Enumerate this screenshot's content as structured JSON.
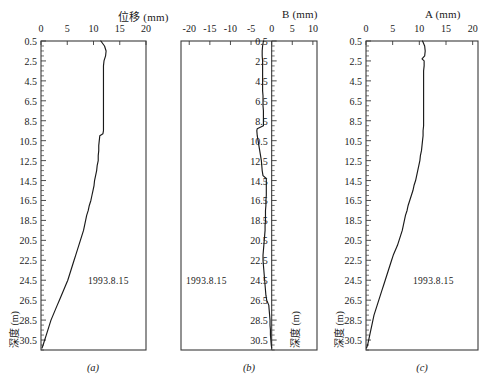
{
  "figure": {
    "background": "#ffffff",
    "line_color": "#1a1a1a",
    "axis_color": "#3a3a3a",
    "panels": [
      {
        "key": "a",
        "caption": "(a)",
        "axis_title": "位移 (mm)",
        "xlabel": "位移 (mm)",
        "ylabel": "深度 (m)",
        "annotation": "1993.8.15",
        "xticks": [
          0,
          5,
          10,
          15,
          20
        ],
        "xlim": [
          0,
          20
        ],
        "ylim": [
          0.5,
          31.5
        ],
        "yticks": [
          0.5,
          2.5,
          4.5,
          6.5,
          8.5,
          10.5,
          12.5,
          14.5,
          16.5,
          18.5,
          20.5,
          22.5,
          24.5,
          26.5,
          28.5,
          30.5
        ]
      },
      {
        "key": "b",
        "caption": "(b)",
        "axis_title": "B (mm)",
        "xlabel": "B (mm)",
        "ylabel": "深度 (m)",
        "annotation": "1993.8.15",
        "xticks": [
          -20,
          -15,
          -10,
          -5,
          0,
          5,
          10
        ],
        "xlim": [
          -22,
          11
        ],
        "ylim": [
          0.5,
          31.5
        ],
        "yticks": [
          0.5,
          2.5,
          4.5,
          6.5,
          8.5,
          10.5,
          12.5,
          14.5,
          16.5,
          18.5,
          20.5,
          22.5,
          24.5,
          26.5,
          28.5,
          30.5
        ]
      },
      {
        "key": "c",
        "caption": "(c)",
        "axis_title": "A (mm)",
        "xlabel": "A (mm)",
        "ylabel": "深度 (m)",
        "annotation": "1993.8.15",
        "xticks": [
          0,
          5,
          10,
          15,
          20
        ],
        "xlim": [
          0,
          21
        ],
        "ylim": [
          0.5,
          31.5
        ],
        "yticks": [
          0.5,
          2.5,
          4.5,
          6.5,
          8.5,
          10.5,
          12.5,
          14.5,
          16.5,
          18.5,
          20.5,
          22.5,
          24.5,
          26.5,
          28.5,
          30.5
        ]
      }
    ]
  },
  "chart_data": [
    {
      "type": "line",
      "title": "位移 (mm)",
      "xlabel": "位移 (mm)",
      "ylabel": "深度 (m)",
      "panel": "(a)",
      "annotations": [
        "1993.8.15"
      ],
      "grid": false,
      "legend": "none",
      "xlim": [
        0,
        20
      ],
      "ylim": [
        31.5,
        0.5
      ],
      "xticks": [
        0,
        5,
        10,
        15,
        20
      ],
      "yticks": [
        0.5,
        2.5,
        4.5,
        6.5,
        8.5,
        10.5,
        12.5,
        14.5,
        16.5,
        18.5,
        20.5,
        22.5,
        24.5,
        26.5,
        28.5,
        30.5
      ],
      "series": [
        {
          "name": "1993.8.15",
          "depth_m": [
            0.5,
            1.0,
            1.5,
            2.0,
            2.5,
            3.0,
            3.5,
            4.0,
            4.5,
            5.0,
            5.5,
            6.0,
            6.5,
            7.0,
            7.5,
            8.0,
            8.5,
            9.0,
            9.5,
            9.8,
            10.0,
            10.5,
            11.0,
            11.5,
            12.0,
            12.5,
            13.0,
            13.5,
            14.0,
            14.5,
            15.0,
            15.5,
            16.0,
            16.5,
            17.0,
            17.5,
            18.0,
            18.5,
            19.0,
            19.5,
            20.0,
            20.5,
            21.0,
            21.5,
            22.0,
            22.5,
            23.0,
            23.5,
            24.0,
            24.5,
            25.0,
            25.5,
            26.0,
            26.5,
            27.0,
            27.5,
            28.0,
            28.5,
            29.0,
            29.5,
            30.0,
            30.5,
            31.0,
            31.3
          ],
          "displacement_mm": [
            11.4,
            12.1,
            12.4,
            12.3,
            12.0,
            11.9,
            11.9,
            11.9,
            11.9,
            11.9,
            11.9,
            11.9,
            11.9,
            11.9,
            11.9,
            11.9,
            11.9,
            11.9,
            11.9,
            11.8,
            11.2,
            11.1,
            11.0,
            11.0,
            10.9,
            10.9,
            10.7,
            10.6,
            10.4,
            10.2,
            10.1,
            9.9,
            9.7,
            9.5,
            9.2,
            9.0,
            8.7,
            8.5,
            8.3,
            8.1,
            7.8,
            7.5,
            7.2,
            6.9,
            6.6,
            6.3,
            6.0,
            5.7,
            5.4,
            5.1,
            4.7,
            4.3,
            3.9,
            3.5,
            3.1,
            2.7,
            2.3,
            1.9,
            1.6,
            1.3,
            1.0,
            0.7,
            0.4,
            0.2
          ]
        }
      ]
    },
    {
      "type": "line",
      "title": "B (mm)",
      "xlabel": "B (mm)",
      "ylabel": "深度 (m)",
      "panel": "(b)",
      "annotations": [
        "1993.8.15"
      ],
      "grid": false,
      "legend": "none",
      "xlim": [
        -22,
        11
      ],
      "ylim": [
        31.5,
        0.5
      ],
      "xticks": [
        -20,
        -15,
        -10,
        -5,
        0,
        5,
        10
      ],
      "yticks": [
        0.5,
        2.5,
        4.5,
        6.5,
        8.5,
        10.5,
        12.5,
        14.5,
        16.5,
        18.5,
        20.5,
        22.5,
        24.5,
        26.5,
        28.5,
        30.5
      ],
      "series": [
        {
          "name": "1993.8.15",
          "depth_m": [
            0.5,
            1.0,
            1.5,
            2.0,
            2.5,
            3.0,
            3.5,
            4.0,
            4.5,
            5.0,
            5.5,
            6.0,
            6.5,
            7.0,
            7.5,
            8.0,
            8.5,
            9.0,
            9.3,
            9.5,
            10.0,
            10.5,
            11.0,
            11.5,
            12.0,
            12.5,
            13.0,
            13.5,
            14.0,
            14.3,
            14.5,
            15.0,
            15.5,
            16.0,
            16.5,
            17.0,
            17.5,
            18.0,
            18.5,
            19.0,
            19.5,
            20.0,
            20.5,
            21.0,
            21.5,
            22.0,
            22.5,
            23.0,
            23.5,
            24.0,
            24.5,
            25.0,
            25.5,
            26.0,
            26.5,
            27.0,
            27.5,
            28.0,
            28.5,
            29.0,
            29.5,
            30.0,
            30.5,
            31.0,
            31.3
          ],
          "displacement_mm": [
            -2.0,
            -2.2,
            -2.3,
            -2.3,
            -2.2,
            -2.2,
            -2.2,
            -2.2,
            -2.2,
            -2.2,
            -2.2,
            -2.1,
            -2.1,
            -2.1,
            -2.0,
            -2.0,
            -2.0,
            -2.0,
            -3.5,
            -3.6,
            -3.5,
            -3.3,
            -3.1,
            -2.9,
            -2.7,
            -2.5,
            -2.4,
            -2.3,
            -2.1,
            -1.3,
            -1.3,
            -1.3,
            -1.3,
            -1.3,
            -1.4,
            -1.4,
            -1.5,
            -1.5,
            -1.5,
            -1.6,
            -1.6,
            -1.7,
            -1.8,
            -1.9,
            -2.0,
            -2.1,
            -2.1,
            -2.0,
            -1.9,
            -1.8,
            -1.7,
            -1.6,
            -1.5,
            -1.4,
            -1.2,
            -0.7,
            -0.6,
            -0.5,
            -0.4,
            -0.4,
            -0.3,
            -0.3,
            -0.2,
            -0.1,
            0.0
          ]
        }
      ]
    },
    {
      "type": "line",
      "title": "A (mm)",
      "xlabel": "A (mm)",
      "ylabel": "深度 (m)",
      "panel": "(c)",
      "annotations": [
        "1993.8.15"
      ],
      "grid": false,
      "legend": "none",
      "xlim": [
        0,
        21
      ],
      "ylim": [
        31.5,
        0.5
      ],
      "xticks": [
        0,
        5,
        10,
        15,
        20
      ],
      "yticks": [
        0.5,
        2.5,
        4.5,
        6.5,
        8.5,
        10.5,
        12.5,
        14.5,
        16.5,
        18.5,
        20.5,
        22.5,
        24.5,
        26.5,
        28.5,
        30.5
      ],
      "series": [
        {
          "name": "1993.8.15",
          "depth_m": [
            0.5,
            1.0,
            1.5,
            2.0,
            2.3,
            2.5,
            3.0,
            3.5,
            4.0,
            4.5,
            5.0,
            5.5,
            6.0,
            6.5,
            7.0,
            7.5,
            8.0,
            8.5,
            9.0,
            9.5,
            10.0,
            10.5,
            11.0,
            11.5,
            12.0,
            12.5,
            13.0,
            13.5,
            14.0,
            14.5,
            15.0,
            15.5,
            16.0,
            16.5,
            17.0,
            17.5,
            18.0,
            18.5,
            19.0,
            19.5,
            20.0,
            20.5,
            21.0,
            21.5,
            22.0,
            22.5,
            23.0,
            23.5,
            24.0,
            24.5,
            25.0,
            25.5,
            26.0,
            26.5,
            27.0,
            27.5,
            28.0,
            28.5,
            29.0,
            29.5,
            30.0,
            30.5,
            31.0,
            31.3
          ],
          "displacement_mm": [
            10.6,
            11.0,
            11.1,
            11.0,
            10.5,
            10.9,
            10.9,
            10.8,
            10.8,
            10.8,
            10.8,
            10.8,
            10.8,
            10.8,
            10.8,
            10.8,
            10.8,
            10.8,
            10.8,
            10.7,
            10.7,
            10.6,
            10.5,
            10.4,
            10.2,
            10.1,
            9.9,
            9.7,
            9.5,
            9.3,
            9.0,
            8.8,
            8.5,
            8.2,
            7.9,
            7.7,
            7.4,
            7.2,
            7.0,
            6.8,
            6.5,
            6.2,
            5.9,
            5.5,
            5.1,
            4.8,
            4.5,
            4.2,
            3.9,
            3.6,
            3.3,
            3.0,
            2.7,
            2.4,
            2.1,
            1.8,
            1.5,
            1.3,
            1.1,
            0.9,
            0.7,
            0.5,
            0.3,
            0.1
          ]
        }
      ]
    }
  ]
}
